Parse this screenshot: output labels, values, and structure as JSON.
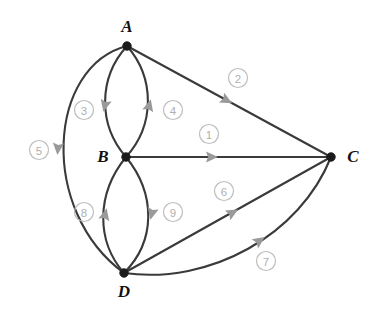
{
  "diagram": {
    "type": "directed-multigraph",
    "title": "",
    "background_color": "#ffffff",
    "edge_color": "#3a3a3a",
    "node_color": "#1b1b1b",
    "label_color": "#111111",
    "badge_color": "#b0b0b0",
    "arrow_color": "#9a9a9a",
    "nodes": [
      {
        "id": "A",
        "label": "A",
        "x": 127,
        "y": 46,
        "label_x": 127,
        "label_y": 28
      },
      {
        "id": "B",
        "label": "B",
        "x": 126,
        "y": 157,
        "label_x": 103,
        "label_y": 158
      },
      {
        "id": "C",
        "label": "C",
        "x": 331,
        "y": 157,
        "label_x": 353,
        "label_y": 158
      },
      {
        "id": "D",
        "label": "D",
        "x": 124,
        "y": 273,
        "label_x": 124,
        "label_y": 293
      }
    ],
    "edges": [
      {
        "id": "1",
        "label": "1",
        "from": "B",
        "to": "C",
        "path": "M 126 157 L 331 157",
        "badge_x": 209,
        "badge_y": 134,
        "arrow_x": 211,
        "arrow_y": 157,
        "arrow_angle": 0
      },
      {
        "id": "2",
        "label": "2",
        "from": "A",
        "to": "C",
        "path": "M 127 46 L 331 157",
        "badge_x": 238,
        "badge_y": 78,
        "arrow_x": 226,
        "arrow_y": 100,
        "arrow_angle": 28.5
      },
      {
        "id": "3",
        "label": "3",
        "from": "A",
        "to": "B",
        "path": "M 127 46 C 98 78 98 125 126 157",
        "badge_x": 84,
        "badge_y": 110,
        "arrow_x": 105,
        "arrow_y": 105,
        "arrow_angle": 104
      },
      {
        "id": "4",
        "label": "4",
        "from": "B",
        "to": "A",
        "path": "M 126 157 C 155 125 155 78 127 46",
        "badge_x": 173,
        "badge_y": 110,
        "arrow_x": 149,
        "arrow_y": 106,
        "arrow_angle": -75
      },
      {
        "id": "5",
        "label": "5",
        "from": "A",
        "to": "D",
        "path": "M 127 46 C 48 66 38 210 124 273",
        "badge_x": 39,
        "badge_y": 150,
        "arrow_x": 58,
        "arrow_y": 148,
        "arrow_angle": 95
      },
      {
        "id": "6",
        "label": "6",
        "from": "D",
        "to": "C",
        "path": "M 124 273 L 331 157",
        "badge_x": 224,
        "badge_y": 191,
        "arrow_x": 232,
        "arrow_y": 213,
        "arrow_angle": -29
      },
      {
        "id": "7",
        "label": "7",
        "from": "D",
        "to": "C",
        "path": "M 124 273 C 210 285 300 235 331 157",
        "badge_x": 266,
        "badge_y": 261,
        "arrow_x": 259,
        "arrow_y": 241,
        "arrow_angle": -35
      },
      {
        "id": "8",
        "label": "8",
        "from": "D",
        "to": "B",
        "path": "M 124 273 C 96 241 96 194 126 157",
        "badge_x": 84,
        "badge_y": 212,
        "arrow_x": 105,
        "arrow_y": 215,
        "arrow_angle": -76
      },
      {
        "id": "9",
        "label": "9",
        "from": "B",
        "to": "D",
        "path": "M 126 157 C 156 194 156 241 124 273",
        "badge_x": 173,
        "badge_y": 212,
        "arrow_x": 152,
        "arrow_y": 213,
        "arrow_angle": 103
      }
    ]
  }
}
